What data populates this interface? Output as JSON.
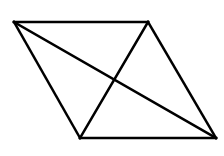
{
  "diagram": {
    "type": "parallelogram-with-diagonals",
    "stroke_color": "#000000",
    "stroke_width": 2.5,
    "background": "#ffffff",
    "vertices": {
      "top_left": [
        14,
        22
      ],
      "top_right": [
        148,
        22
      ],
      "bottom_right": [
        216,
        138
      ],
      "bottom_left": [
        80,
        138
      ]
    },
    "edges": [
      {
        "name": "top-edge",
        "from": "top_left",
        "to": "top_right"
      },
      {
        "name": "right-edge",
        "from": "top_right",
        "to": "bottom_right"
      },
      {
        "name": "bottom-edge",
        "from": "bottom_right",
        "to": "bottom_left"
      },
      {
        "name": "left-edge",
        "from": "bottom_left",
        "to": "top_left"
      }
    ],
    "diagonals": [
      {
        "name": "diagonal-tl-br",
        "from": "top_left",
        "to": "bottom_right"
      },
      {
        "name": "diagonal-tr-bl",
        "from": "top_right",
        "to": "bottom_left"
      }
    ]
  }
}
